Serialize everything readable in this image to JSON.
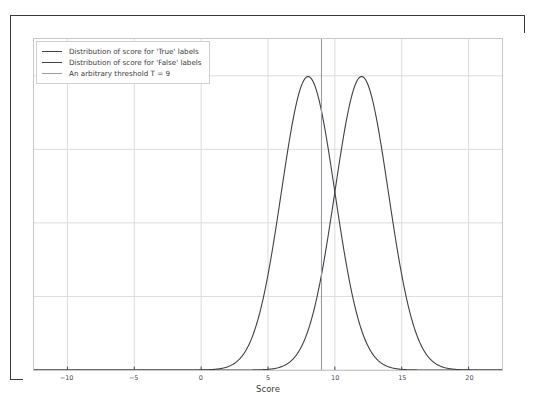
{
  "top_clip_text": "                                                                           ",
  "legend": {
    "items": [
      {
        "label": "Distribution of score for 'True' labels",
        "color": "#3f3f46",
        "icon": "line-swatch-icon"
      },
      {
        "label": "Distribution of score for 'False' labels",
        "color": "#3f3f46",
        "icon": "line-swatch-icon"
      },
      {
        "label": "An arbitrary threshold T = 9",
        "color": "#9a9aa2",
        "icon": "line-swatch-icon"
      }
    ]
  },
  "colors": {
    "true_curve": "#3f3f46",
    "false_curve": "#3f3f46",
    "threshold": "#9a9aa2",
    "grid": "#dcdcdc",
    "axis_spine": "#c8c8c8",
    "tick_text": "#4a4a4a",
    "page_border": "#3a3a3a",
    "background": "#ffffff"
  },
  "chart_data": {
    "type": "line",
    "title": "",
    "xlabel": "Score",
    "ylabel": "",
    "xlim": [
      -12.5,
      22.5
    ],
    "ylim": [
      0,
      0.225
    ],
    "xticks": [
      -10,
      -5,
      0,
      5,
      10,
      15,
      20
    ],
    "xtick_labels": [
      "−10",
      "−5",
      "0",
      "5",
      "10",
      "15",
      "20"
    ],
    "yticks": [
      0.0,
      0.05,
      0.1,
      0.15,
      0.2
    ],
    "ytick_labels": [],
    "grid": true,
    "legend_position": "upper left",
    "series": [
      {
        "name": "Distribution of score for 'True' labels",
        "kind": "gaussian-pdf",
        "mean": 8,
        "std": 2,
        "peak_y": 0.1995,
        "color": "#3f3f46"
      },
      {
        "name": "Distribution of score for 'False' labels",
        "kind": "gaussian-pdf",
        "mean": 12,
        "std": 2,
        "peak_y": 0.1995,
        "color": "#3f3f46"
      }
    ],
    "annotations": [
      {
        "name": "An arbitrary threshold T = 9",
        "kind": "vertical-line",
        "x": 9,
        "color": "#9a9aa2"
      }
    ],
    "intersection": {
      "x": 10,
      "y": 0.121
    }
  }
}
